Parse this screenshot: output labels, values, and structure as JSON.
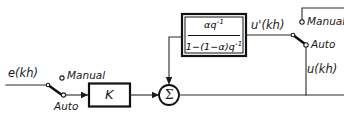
{
  "diagram": {
    "background_color": "#ffffff",
    "line_color": "#1a1a1a",
    "signals": {
      "input": "e(kh)",
      "filter_output": "u'(kh)",
      "plant_output": "u(kh)"
    },
    "blocks": {
      "gain": "K",
      "summing_junction": "Σ",
      "transfer_function": {
        "numerator_base": "αq",
        "numerator_exponent": "-1",
        "denominator_prefix": "1−(1−α)q",
        "denominator_exponent": "-1",
        "full": "αq⁻¹ / (1−(1−α)q⁻¹)"
      }
    },
    "switches": {
      "input_switch": {
        "manual_label": "Manual",
        "auto_label": "Auto",
        "selected": "Auto"
      },
      "output_switch": {
        "manual_label": "Manual",
        "auto_label": "Auto",
        "selected": "Auto"
      }
    }
  }
}
